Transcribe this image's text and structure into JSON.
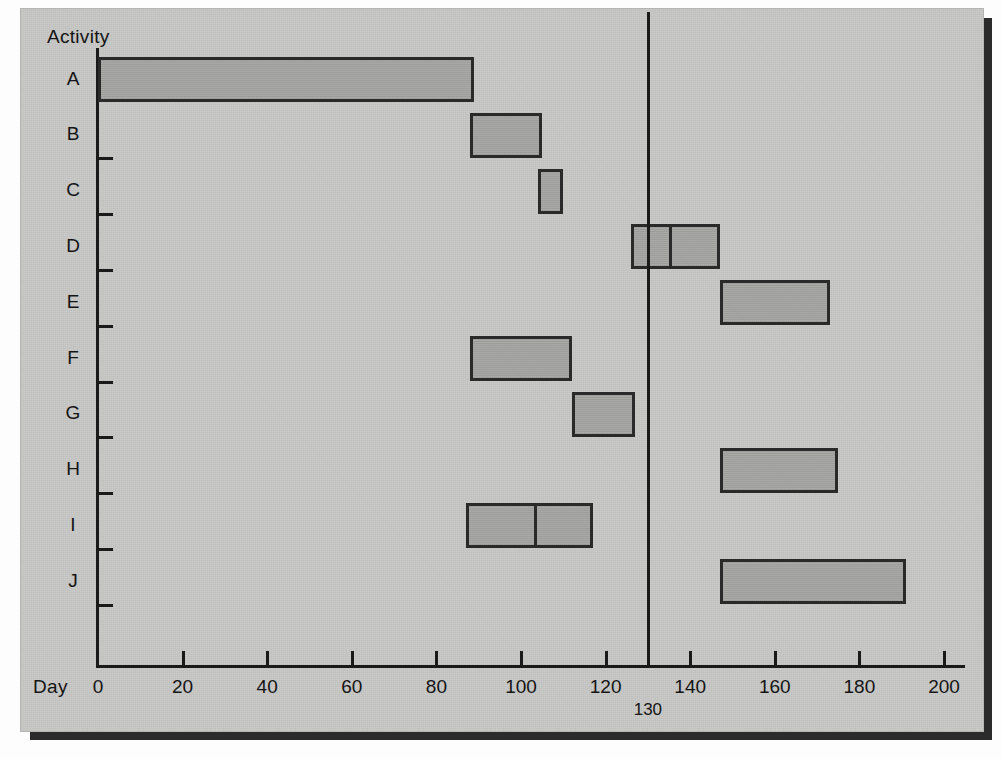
{
  "chart_data": {
    "type": "bar",
    "subtype": "gantt",
    "title": "",
    "xlabel": "Day",
    "ylabel": "Activity",
    "xlim": [
      0,
      205
    ],
    "xticks": [
      0,
      20,
      40,
      60,
      80,
      100,
      120,
      140,
      160,
      180,
      200
    ],
    "xticklabels": [
      "0",
      "20",
      "40",
      "60",
      "80",
      "100",
      "120",
      "140",
      "160",
      "180",
      "200"
    ],
    "categories": [
      "A",
      "B",
      "C",
      "D",
      "E",
      "F",
      "G",
      "H",
      "I",
      "J"
    ],
    "grid": false,
    "legend": null,
    "annotations": [
      {
        "name": "milestone",
        "value": 130,
        "label": "130",
        "orientation": "vertical"
      }
    ],
    "bars": [
      {
        "activity": "A",
        "start": 0,
        "end": 89,
        "splits": []
      },
      {
        "activity": "B",
        "start": 88,
        "end": 105,
        "splits": []
      },
      {
        "activity": "C",
        "start": 104,
        "end": 110,
        "splits": []
      },
      {
        "activity": "D",
        "start": 126,
        "end": 147,
        "splits": [
          135
        ]
      },
      {
        "activity": "E",
        "start": 147,
        "end": 173,
        "splits": []
      },
      {
        "activity": "F",
        "start": 88,
        "end": 112,
        "splits": []
      },
      {
        "activity": "G",
        "start": 112,
        "end": 127,
        "splits": []
      },
      {
        "activity": "H",
        "start": 147,
        "end": 175,
        "splits": []
      },
      {
        "activity": "I",
        "start": 87,
        "end": 117,
        "splits": [
          103
        ]
      },
      {
        "activity": "J",
        "start": 147,
        "end": 191,
        "splits": []
      }
    ],
    "colors": {
      "bar_fill": "#a6a6a4",
      "bar_border": "#2a2a2a",
      "axis": "#1a1a1a",
      "panel_background": "#c9c9c7",
      "text": "#141414"
    }
  }
}
